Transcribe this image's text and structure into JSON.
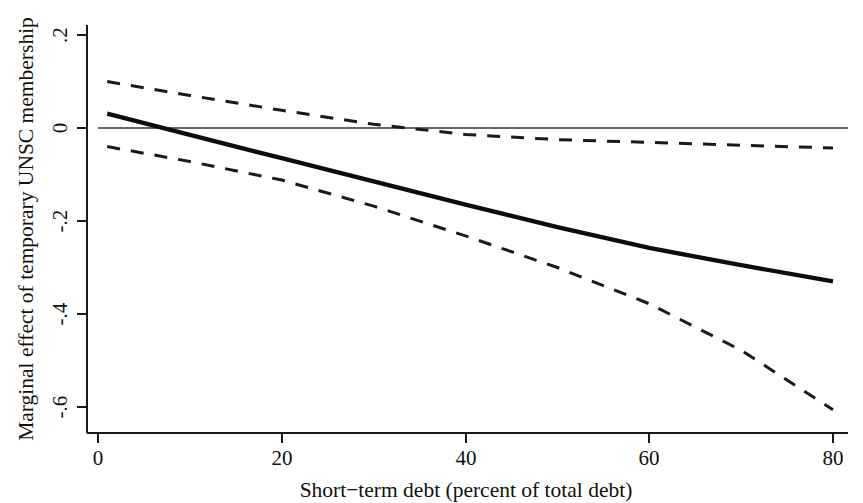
{
  "chart_data": {
    "type": "line",
    "title": "",
    "xlabel": "Short−term debt (percent of total debt)",
    "ylabel": "Marginal effect of temporary UNSC membership",
    "xlim": [
      0,
      80
    ],
    "ylim": [
      -0.68,
      0.24
    ],
    "xticks": [
      0,
      20,
      40,
      60,
      80
    ],
    "xticklabels": [
      "0",
      "20",
      "40",
      "60",
      "80"
    ],
    "yticks": [
      0.2,
      0,
      -0.2,
      -0.4,
      -0.6
    ],
    "yticklabels": [
      ".2",
      "0",
      "-.2",
      "-.4",
      "-.6"
    ],
    "grid": false,
    "legend": "none",
    "zero_reference_line": 0,
    "x": [
      1,
      10,
      20,
      30,
      40,
      50,
      60,
      70,
      80
    ],
    "series": [
      {
        "name": "Marginal effect",
        "style": "solid",
        "values": [
          0.031,
          -0.015,
          -0.065,
          -0.115,
          -0.165,
          -0.213,
          -0.258,
          -0.295,
          -0.33
        ]
      },
      {
        "name": "Upper 95% confidence bound",
        "style": "dashed",
        "values": [
          0.1,
          0.07,
          0.038,
          0.008,
          -0.014,
          -0.025,
          -0.031,
          -0.037,
          -0.043
        ]
      },
      {
        "name": "Lower 95% confidence bound",
        "style": "dashed",
        "values": [
          -0.04,
          -0.072,
          -0.112,
          -0.168,
          -0.232,
          -0.3,
          -0.378,
          -0.478,
          -0.606
        ]
      }
    ],
    "annotations": {
      "zero_crossing_x": 7.3,
      "significance_note": "Effect becomes statistically significant (upper bound below zero) beyond about x = 23"
    }
  }
}
